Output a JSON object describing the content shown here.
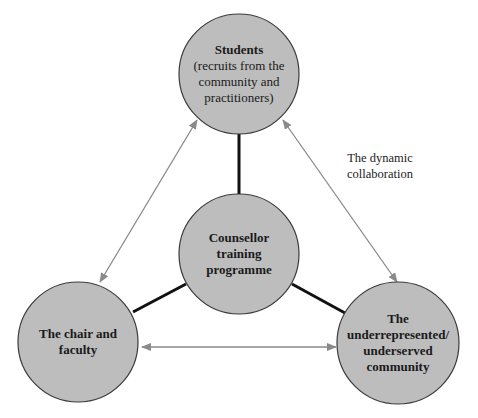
{
  "colors": {
    "node_fill": "#bdbdbd",
    "node_stroke": "#3a3a3a",
    "connector": "#111111",
    "arrow": "#8a8a8a",
    "background": "#ffffff"
  },
  "nodes": {
    "students": {
      "title": "Students",
      "subtitle": "(recruits from the community and practitioners)"
    },
    "center": {
      "title": "Counsellor training programme"
    },
    "faculty": {
      "title": "The chair and faculty"
    },
    "community": {
      "title": "The underrepresented/ underserved community"
    }
  },
  "annotation": {
    "line1": "The dynamic",
    "line2": "collaboration"
  }
}
